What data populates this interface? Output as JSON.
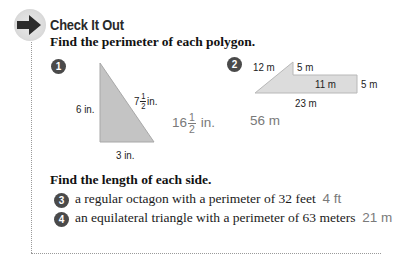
{
  "section": {
    "icon": "arrow-right-icon",
    "title": "Check It Out"
  },
  "part1": {
    "instruction": "Find the perimeter of each polygon.",
    "problems": [
      {
        "number": "1",
        "shape": "right triangle",
        "labels": {
          "left": "6 in.",
          "hyp_whole": "7",
          "hyp_num": "1",
          "hyp_den": "2",
          "hyp_unit": "in.",
          "bottom": "3 in."
        },
        "answer": {
          "whole": "16",
          "num": "1",
          "den": "2",
          "unit": "in."
        }
      },
      {
        "number": "2",
        "shape": "polygon",
        "labels": {
          "slant": "12 m",
          "top": "5 m",
          "inner": "11 m",
          "right": "5 m",
          "bottom": "23 m"
        },
        "answer": "56 m"
      }
    ]
  },
  "part2": {
    "instruction": "Find the length of each side.",
    "problems": [
      {
        "number": "3",
        "text": "a regular octagon with a perimeter of 32 feet",
        "answer": "4 ft"
      },
      {
        "number": "4",
        "text": "an equilateral triangle with a perimeter of 63 meters",
        "answer": "21 m"
      }
    ]
  },
  "colors": {
    "shape_fill": "#c4c4c4",
    "shape2_fill": "#dcdcdc",
    "answer": "#7a7a7a",
    "badge": "#4a4a4a"
  }
}
